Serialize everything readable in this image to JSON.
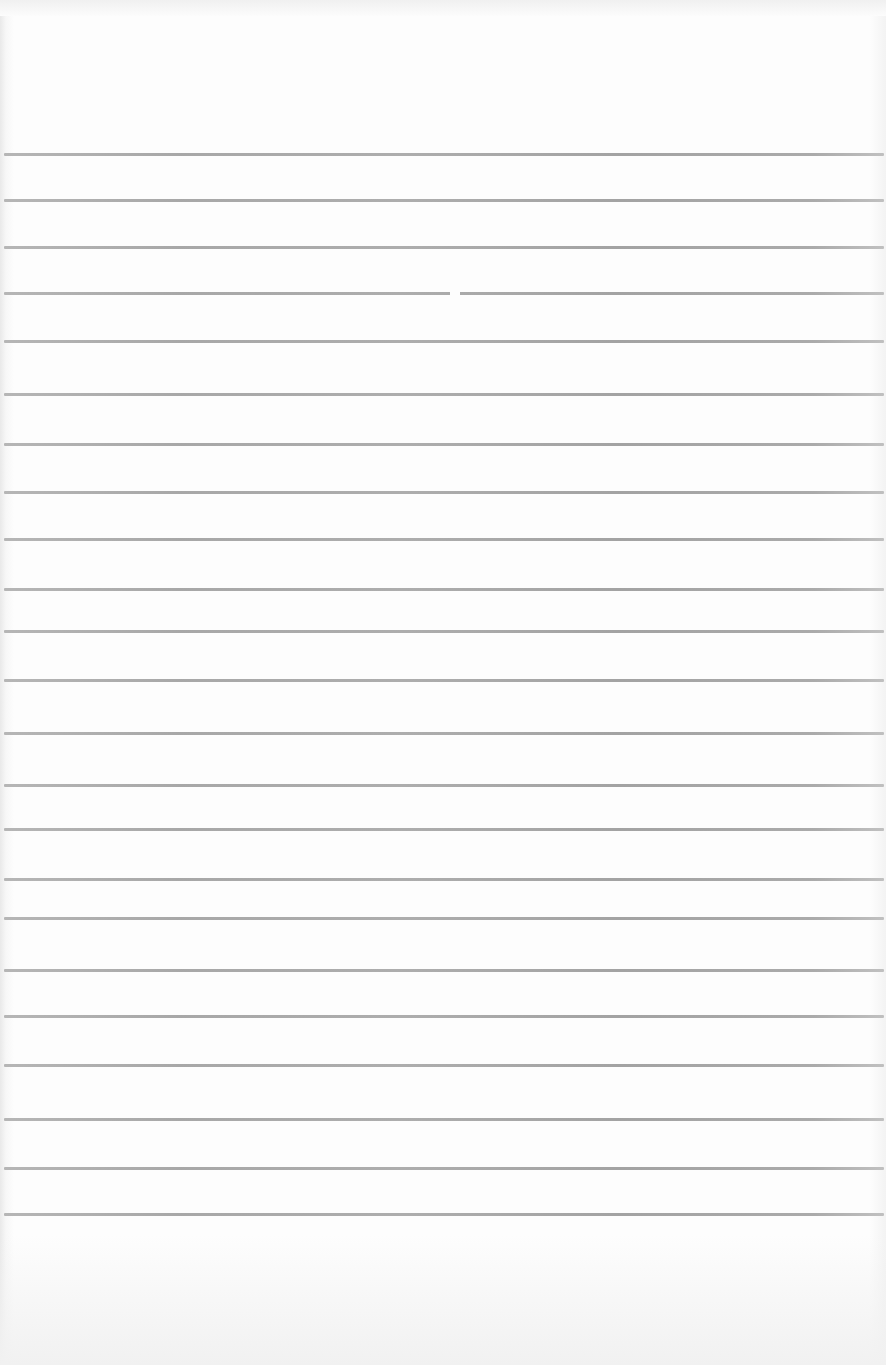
{
  "document": {
    "type": "blank ruled paper",
    "background_color": "#fdfdfd",
    "rule_color": "#a6a6a6",
    "rule_count": 23,
    "rules_y": [
      154,
      200,
      247,
      293,
      341,
      394,
      444,
      492,
      539,
      589,
      631,
      680,
      733,
      785,
      829,
      879,
      918,
      970,
      1016,
      1065,
      1119,
      1168,
      1214
    ],
    "text": ""
  }
}
